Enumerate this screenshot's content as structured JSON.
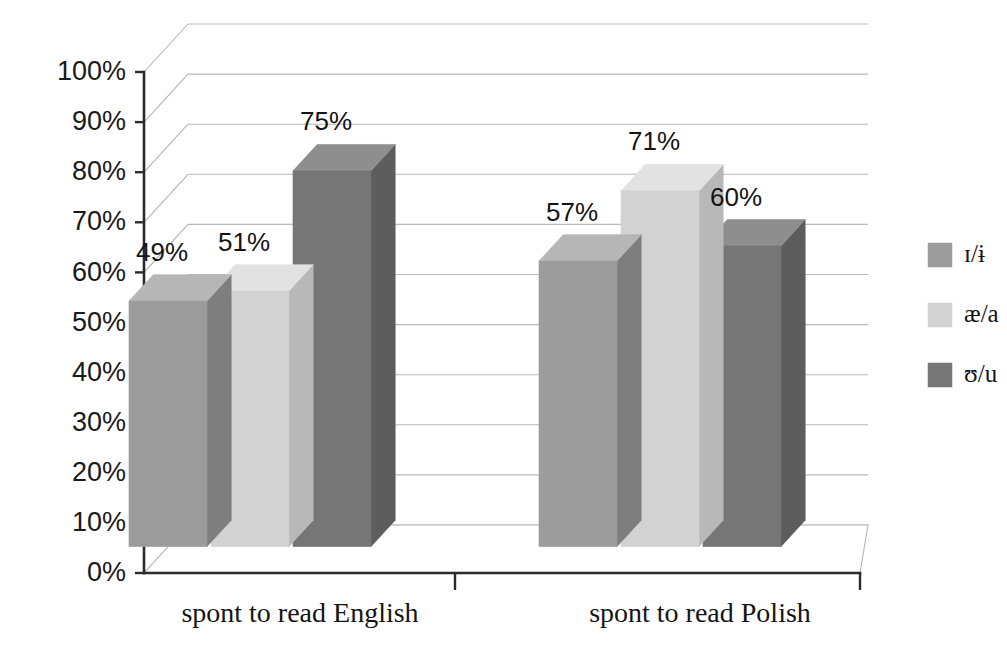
{
  "chart_data": {
    "type": "bar",
    "title": "",
    "subtitle": "",
    "xlabel": "",
    "ylabel": "",
    "categories": [
      "spont to read English",
      "spont to read Polish"
    ],
    "series": [
      {
        "name": "ɪ/ɨ",
        "values": [
          49,
          71
        ],
        "color": "#9c9c9c"
      },
      {
        "name": "æ/a",
        "values": [
          51,
          71
        ],
        "color": "#d2d2d2"
      },
      {
        "name": "ʊ/u",
        "values": [
          75,
          60
        ],
        "color": "#767676"
      }
    ],
    "data_by_group": [
      {
        "category": "spont to read English",
        "points": [
          {
            "series": "ɪ/ɨ",
            "value": 49,
            "label": "49%"
          },
          {
            "series": "æ/a",
            "value": 51,
            "label": "51%"
          },
          {
            "series": "ʊ/u",
            "value": 75,
            "label": "75%"
          }
        ]
      },
      {
        "category": "spont to read Polish",
        "points": [
          {
            "series": "ɪ/ɨ",
            "value": 57,
            "label": "57%"
          },
          {
            "series": "æ/a",
            "value": 71,
            "label": "71%"
          },
          {
            "series": "ʊ/u",
            "value": 60,
            "label": "60%"
          }
        ]
      }
    ],
    "ylim": [
      0,
      100
    ],
    "yticks": [
      0,
      10,
      20,
      30,
      40,
      50,
      60,
      70,
      80,
      90,
      100
    ],
    "ytick_labels": [
      "0%",
      "10%",
      "20%",
      "30%",
      "40%",
      "50%",
      "60%",
      "70%",
      "80%",
      "90%",
      "100%"
    ],
    "grid": true,
    "legend_position": "right",
    "three_d": true,
    "unit": "%"
  },
  "axis": {
    "y_labels": [
      "100%",
      "90%",
      "80%",
      "70%",
      "60%",
      "50%",
      "40%",
      "30%",
      "20%",
      "10%",
      "0%"
    ],
    "x_labels": [
      "spont to read English",
      "spont to read Polish"
    ]
  },
  "value_labels": {
    "g1s1": "49%",
    "g1s2": "51%",
    "g1s3": "75%",
    "g2s1": "57%",
    "g2s2": "71%",
    "g2s3": "60%"
  },
  "legend": {
    "items": [
      {
        "label": "ɪ/ɨ",
        "color": "#9c9c9c"
      },
      {
        "label": "æ/a",
        "color": "#d2d2d2"
      },
      {
        "label": "ʊ/u",
        "color": "#767676"
      }
    ]
  },
  "colors": {
    "series_1_front": "#9c9c9c",
    "series_1_top": "#b6b6b6",
    "series_1_side": "#7e7e7e",
    "series_2_front": "#d2d2d2",
    "series_2_top": "#e2e2e2",
    "series_2_side": "#b8b8b8",
    "series_3_front": "#767676",
    "series_3_top": "#8e8e8e",
    "series_3_side": "#5d5d5d",
    "grid": "#b9b9b9",
    "axis": "#2b2b2b",
    "background": "#ffffff",
    "text": "#141414"
  }
}
